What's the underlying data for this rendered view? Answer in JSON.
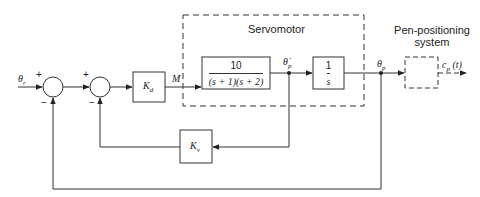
{
  "diagram": {
    "type": "block-diagram",
    "input": {
      "symbol": "θ",
      "subscript": "r"
    },
    "output": {
      "symbol": "c",
      "subscript": "p",
      "suffix": "(t)"
    },
    "summing_junctions": [
      {
        "id": "sum1",
        "plus": "+",
        "minus": "−"
      },
      {
        "id": "sum2",
        "plus": "+",
        "minus": "−"
      }
    ],
    "blocks": {
      "kd": {
        "symbol": "K",
        "subscript": "d"
      },
      "plant": {
        "numerator": "10",
        "denominator": "(s + 1)(s + 2)"
      },
      "integrator": {
        "numerator": "1",
        "denominator": "s"
      },
      "kv": {
        "symbol": "K",
        "subscript": "v"
      }
    },
    "signals": {
      "m": "M",
      "theta_dot": {
        "symbol": "θ̇",
        "subscript": "p"
      },
      "theta_p": {
        "symbol": "θ",
        "subscript": "p"
      }
    },
    "groups": {
      "servomotor": "Servomotor",
      "pen_line1": "Pen-positioning",
      "pen_line2": "system"
    },
    "colors": {
      "stroke": "#333333",
      "background": "#ffffff"
    }
  }
}
